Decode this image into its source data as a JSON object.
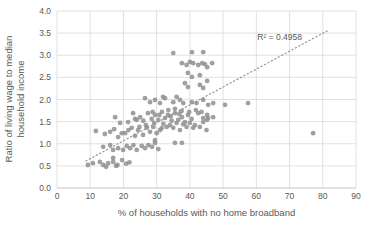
{
  "chart_data": {
    "type": "scatter",
    "title": "",
    "xlabel": "% of households with no home broadband",
    "ylabel_line1": "Ratio of living wage to median",
    "ylabel_line2": "household income",
    "annotation": "R² = 0.4958",
    "r_squared": 0.4958,
    "xlim": [
      0,
      90
    ],
    "ylim": [
      0.0,
      4.0
    ],
    "x_ticks": [
      0,
      10,
      20,
      30,
      40,
      50,
      60,
      70,
      80,
      90
    ],
    "y_ticks": [
      "0.0",
      "0.5",
      "1.0",
      "1.5",
      "2.0",
      "2.5",
      "3.0",
      "3.5",
      "4.0"
    ],
    "grid": true,
    "legend": "none",
    "colors": {
      "marker": "#8f8f8f",
      "gridline": "#d9d9d9",
      "axis_line": "#bfbfbf",
      "axis_text": "#595959",
      "trendline": "#8c8c8c"
    },
    "trendline": {
      "style": "dotted",
      "x1": 8.7,
      "y1": 0.61,
      "x2": 81.3,
      "y2": 3.55
    },
    "annotation_pos": {
      "x": 67,
      "y": 3.41
    },
    "points": [
      [
        9.3,
        0.52
      ],
      [
        10.8,
        0.56
      ],
      [
        12.9,
        0.59
      ],
      [
        13.9,
        0.52
      ],
      [
        14.8,
        0.48
      ],
      [
        15.4,
        0.56
      ],
      [
        16.9,
        0.59
      ],
      [
        17.8,
        0.5
      ],
      [
        18.2,
        0.52
      ],
      [
        19.6,
        0.63
      ],
      [
        16.9,
        0.68
      ],
      [
        20.8,
        0.55
      ],
      [
        21.8,
        0.58
      ],
      [
        13.9,
        0.93
      ],
      [
        16,
        0.97
      ],
      [
        16.9,
        0.86
      ],
      [
        18.4,
        0.9
      ],
      [
        19.9,
        0.86
      ],
      [
        21,
        0.95
      ],
      [
        22,
        0.9
      ],
      [
        23,
        0.97
      ],
      [
        24,
        0.86
      ],
      [
        25.5,
        0.95
      ],
      [
        26.5,
        0.9
      ],
      [
        27.5,
        0.97
      ],
      [
        28.6,
        0.93
      ],
      [
        29.5,
        1.02
      ],
      [
        30.5,
        0.88
      ],
      [
        11.7,
        1.29
      ],
      [
        14.4,
        1.22
      ],
      [
        16,
        1.27
      ],
      [
        17.2,
        1.33
      ],
      [
        18.4,
        1.15
      ],
      [
        19.5,
        1.24
      ],
      [
        20.5,
        1.24
      ],
      [
        21.5,
        1.31
      ],
      [
        22.5,
        1.36
      ],
      [
        23.5,
        1.18
      ],
      [
        24.4,
        1.31
      ],
      [
        25.9,
        1.2
      ],
      [
        27,
        1.36
      ],
      [
        28,
        1.27
      ],
      [
        29,
        1.38
      ],
      [
        29.5,
        1.08
      ],
      [
        30,
        1.24
      ],
      [
        31,
        1.31
      ],
      [
        31.5,
        1.35
      ],
      [
        32,
        1.45
      ],
      [
        33,
        1.38
      ],
      [
        34,
        1.42
      ],
      [
        35,
        1.36
      ],
      [
        36,
        1.47
      ],
      [
        37,
        1.31
      ],
      [
        38,
        1.44
      ],
      [
        39,
        1.38
      ],
      [
        40,
        1.47
      ],
      [
        41,
        1.36
      ],
      [
        41.5,
        1.42
      ],
      [
        43,
        1.38
      ],
      [
        44,
        1.49
      ],
      [
        45,
        1.31
      ],
      [
        17.5,
        1.6
      ],
      [
        19,
        1.47
      ],
      [
        21.4,
        1.49
      ],
      [
        22.9,
        1.69
      ],
      [
        24,
        1.54
      ],
      [
        25,
        1.6
      ],
      [
        23.5,
        1.56
      ],
      [
        24.8,
        1.38
      ],
      [
        26,
        1.52
      ],
      [
        26.8,
        1.42
      ],
      [
        27.4,
        1.69
      ],
      [
        28.5,
        1.56
      ],
      [
        28.8,
        1.72
      ],
      [
        29.2,
        1.47
      ],
      [
        29.5,
        1.65
      ],
      [
        30.5,
        1.54
      ],
      [
        30.8,
        1.65
      ],
      [
        31.6,
        1.72
      ],
      [
        32.5,
        1.58
      ],
      [
        33.4,
        1.65
      ],
      [
        34.2,
        1.62
      ],
      [
        34.5,
        1.52
      ],
      [
        35.5,
        1.69
      ],
      [
        36.5,
        1.54
      ],
      [
        36.8,
        1.67
      ],
      [
        37.6,
        1.6
      ],
      [
        38.5,
        1.49
      ],
      [
        39.4,
        1.65
      ],
      [
        40.5,
        1.56
      ],
      [
        42.5,
        1.69
      ],
      [
        44,
        1.58
      ],
      [
        33.5,
        1.76
      ],
      [
        35.5,
        1.79
      ],
      [
        37.5,
        1.74
      ],
      [
        39.8,
        1.72
      ],
      [
        41.8,
        1.76
      ],
      [
        43.5,
        1.72
      ],
      [
        45.5,
        1.58
      ],
      [
        47,
        1.6
      ],
      [
        45.2,
        1.65
      ],
      [
        45.2,
        1.54
      ],
      [
        26.5,
        2.03
      ],
      [
        28,
        1.94
      ],
      [
        29.5,
        1.99
      ],
      [
        31,
        1.92
      ],
      [
        31.9,
        2.06
      ],
      [
        32.5,
        2.03
      ],
      [
        35,
        1.94
      ],
      [
        36,
        2.06
      ],
      [
        37,
        1.99
      ],
      [
        38,
        1.92
      ],
      [
        40.6,
        1.94
      ],
      [
        42,
        1.92
      ],
      [
        44,
        1.99
      ],
      [
        45.5,
        1.88
      ],
      [
        47,
        1.92
      ],
      [
        50.6,
        1.88
      ],
      [
        57.5,
        1.92
      ],
      [
        38.5,
        2.37
      ],
      [
        39.4,
        2.28
      ],
      [
        43,
        2.33
      ],
      [
        44,
        2.26
      ],
      [
        39.4,
        2.6
      ],
      [
        40.6,
        2.51
      ],
      [
        43,
        2.55
      ],
      [
        45.2,
        2.42
      ],
      [
        37.6,
        2.82
      ],
      [
        39,
        2.78
      ],
      [
        40,
        2.85
      ],
      [
        41,
        2.82
      ],
      [
        42.5,
        2.78
      ],
      [
        43.7,
        2.82
      ],
      [
        44.5,
        2.8
      ],
      [
        45.2,
        2.73
      ],
      [
        46.7,
        2.82
      ],
      [
        35,
        3.05
      ],
      [
        40.6,
        3.07
      ],
      [
        44,
        3.07
      ],
      [
        35.5,
        1.02
      ],
      [
        37.6,
        1.02
      ],
      [
        77.1,
        1.24
      ]
    ],
    "plot_area_px": {
      "left": 57,
      "right": 356,
      "top": 11,
      "bottom": 188
    }
  }
}
